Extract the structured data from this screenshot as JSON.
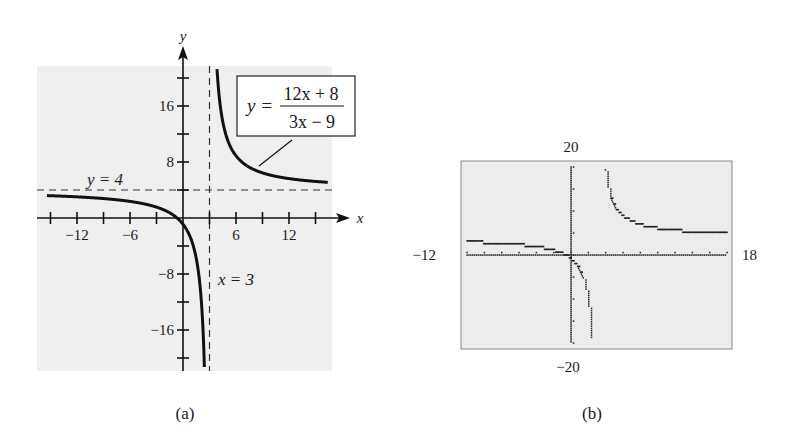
{
  "chart_data": [
    {
      "type": "line",
      "panel_label": "(a)",
      "title": "",
      "function": "y = (12x + 8)/(3x - 9)",
      "equation_box": {
        "lhs": "y =",
        "numerator": "12x + 8",
        "denominator": "3x − 9"
      },
      "xlabel": "x",
      "ylabel": "y",
      "xlim": [
        -15,
        16
      ],
      "ylim": [
        -21,
        22
      ],
      "x_tick_labels": [
        "−12",
        "−6",
        "6",
        "12"
      ],
      "x_tick_values": [
        -12,
        -6,
        6,
        12
      ],
      "x_minor_ticks": [
        -15,
        -12,
        -9,
        -6,
        -3,
        3,
        6,
        9,
        12,
        15
      ],
      "y_tick_labels": [
        "16",
        "8",
        "−8",
        "−16"
      ],
      "y_tick_values": [
        16,
        8,
        -8,
        -16
      ],
      "y_minor_ticks": [
        20,
        16,
        12,
        8,
        4,
        -4,
        -8,
        -12,
        -16,
        -20
      ],
      "asymptotes": [
        {
          "type": "horizontal",
          "value": 4,
          "label": "y = 4",
          "style": "dashed"
        },
        {
          "type": "vertical",
          "value": 3,
          "label": "x = 3",
          "style": "dashed"
        }
      ],
      "series": [
        {
          "name": "left branch",
          "x": [
            -15,
            -12,
            -9,
            -6,
            -3,
            -2,
            -1,
            0,
            1,
            2,
            2.5
          ],
          "y": [
            3.07,
            3.11,
            3.17,
            3.26,
            3.56,
            3.47,
            0.33,
            -0.89,
            -3.33,
            -10.67,
            -25.33
          ]
        },
        {
          "name": "right branch",
          "x": [
            3.5,
            4,
            5,
            6,
            8,
            10,
            12,
            15
          ],
          "y": [
            33.33,
            18.67,
            11.33,
            8.89,
            6.93,
            6.1,
            5.63,
            5.22
          ]
        }
      ],
      "grid": false
    },
    {
      "type": "scatter",
      "panel_label": "(b)",
      "title": "Graphing calculator window",
      "function": "y = (12x + 8)/(3x - 9)",
      "window": {
        "xmin": -12,
        "xmax": 18,
        "ymin": -20,
        "ymax": 20
      },
      "window_labels": {
        "xmin": "−12",
        "xmax": "18",
        "ymin": "−20",
        "ymax": "20"
      },
      "x_tick_step": 2,
      "y_tick_step": 5,
      "grid": false
    }
  ],
  "colors": {
    "plot_bg": "#efefef",
    "calc_bg": "#eaeaea",
    "curve": "#111111",
    "axis": "#111111",
    "dashed": "#333333",
    "frame": "#888888"
  }
}
